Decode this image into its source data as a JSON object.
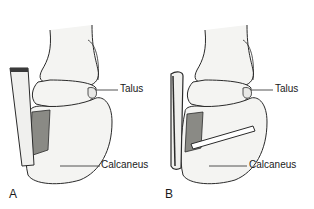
{
  "figure": {
    "panels": [
      {
        "letter": "A",
        "labels": {
          "talus": "Talus",
          "calcaneus": "Calcaneus"
        },
        "description": "Ankle with bone block / strut graft at posterior calcaneus"
      },
      {
        "letter": "B",
        "labels": {
          "talus": "Talus",
          "calcaneus": "Calcaneus"
        },
        "description": "Ankle with screw fixation through calcaneus"
      }
    ],
    "colors": {
      "line": "#2a2a2a",
      "bone_fill": "#f4f4f2",
      "shade": "#8a8a85",
      "background": "#ffffff"
    }
  }
}
